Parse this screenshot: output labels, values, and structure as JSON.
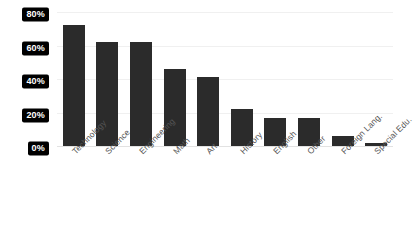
{
  "chart_data": {
    "type": "bar",
    "title": "",
    "subtitle": "",
    "xlabel": "",
    "ylabel": "",
    "ylim": [
      0,
      80
    ],
    "grid": true,
    "legend": false,
    "orientation": "vertical",
    "bar_color": "#2b2b2b",
    "background_color": "#ffffff",
    "gridline_color": "#f0f0f0",
    "tick_label_background": "#000000",
    "tick_label_color": "#ffffff",
    "categories": [
      "Technology",
      "Science",
      "Engineering",
      "Math",
      "Art",
      "History",
      "English",
      "Other",
      "Foreign Lang.",
      "Special Edu."
    ],
    "values": [
      72,
      62,
      62,
      46,
      41,
      22,
      17,
      17,
      6,
      2
    ],
    "yticks": [
      0,
      20,
      40,
      60,
      80
    ],
    "ytick_labels": [
      "0%",
      "20%",
      "40%",
      "60%",
      "80%"
    ]
  }
}
